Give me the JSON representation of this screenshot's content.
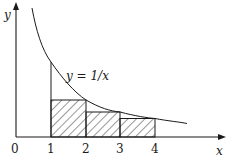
{
  "diagram": {
    "type": "riemann-sum-under-curve",
    "curve_label": "y = 1/x",
    "axis_labels": {
      "x": "x",
      "y": "y"
    },
    "x_ticks": [
      "0",
      "1",
      "2",
      "3",
      "4"
    ],
    "rectangles": [
      {
        "from": 1,
        "to": 2,
        "height": 0.5
      },
      {
        "from": 2,
        "to": 3,
        "height": 0.3333
      },
      {
        "from": 3,
        "to": 4,
        "height": 0.25
      }
    ],
    "colors": {
      "ink": "#1a1a1a",
      "background": "#ffffff"
    }
  }
}
